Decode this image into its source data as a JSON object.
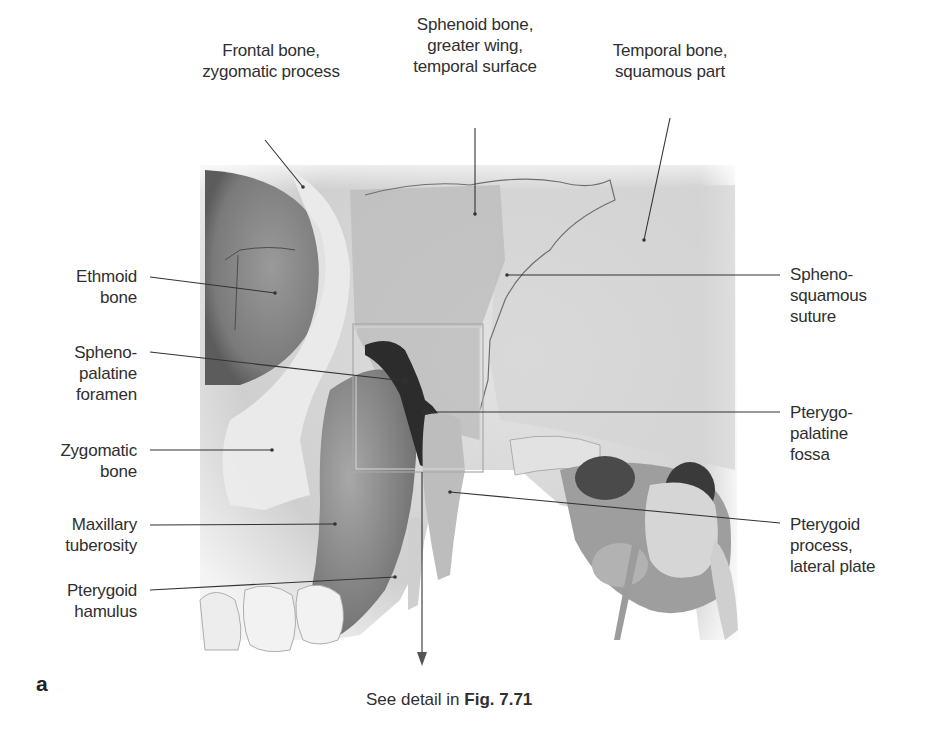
{
  "figure": {
    "panel_letter": "a",
    "caption_prefix": "See detail in ",
    "caption_ref": "Fig. 7.71",
    "colors": {
      "background": "#ffffff",
      "bone_light": "#e6e6e6",
      "bone_mid": "#bdbdbd",
      "bone_dark": "#6e6e6e",
      "cavity": "#3a3a3a",
      "leader_line": "#333333",
      "detail_box": "#9a9a9a"
    },
    "labels": {
      "top": [
        {
          "id": "frontal-bone-zygomatic-process",
          "text": "Frontal bone,\nzygomatic process"
        },
        {
          "id": "sphenoid-bone-greater-wing",
          "text": "Sphenoid bone,\ngreater wing,\ntemporal surface"
        },
        {
          "id": "temporal-bone-squamous-part",
          "text": "Temporal bone,\nsquamous part"
        }
      ],
      "left": [
        {
          "id": "ethmoid-bone",
          "text": "Ethmoid\nbone"
        },
        {
          "id": "sphenopalatine-foramen",
          "text": "Spheno-\npalatine\nforamen"
        },
        {
          "id": "zygomatic-bone",
          "text": "Zygomatic\nbone"
        },
        {
          "id": "maxillary-tuberosity",
          "text": "Maxillary\ntuberosity"
        },
        {
          "id": "pterygoid-hamulus",
          "text": "Pterygoid\nhamulus"
        }
      ],
      "right": [
        {
          "id": "sphenosquamous-suture",
          "text": "Spheno-\nsquamous\nsuture"
        },
        {
          "id": "pterygopalatine-fossa",
          "text": "Pterygo-\npalatine\nfossa"
        },
        {
          "id": "pterygoid-process-lateral-plate",
          "text": "Pterygoid\nprocess,\nlateral plate"
        }
      ]
    }
  }
}
